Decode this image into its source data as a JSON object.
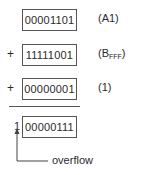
{
  "rows": [
    {
      "value": "00001101",
      "label": "(A1)",
      "operator": ""
    },
    {
      "value": "11111001",
      "label_main": "(B",
      "label_sub": "FFF",
      "label_end": ")",
      "operator": "+"
    },
    {
      "value": "00000001",
      "label": "(1)",
      "operator": "+"
    }
  ],
  "result": {
    "carry": "1",
    "value": "00000111"
  },
  "annotation": "overflow"
}
